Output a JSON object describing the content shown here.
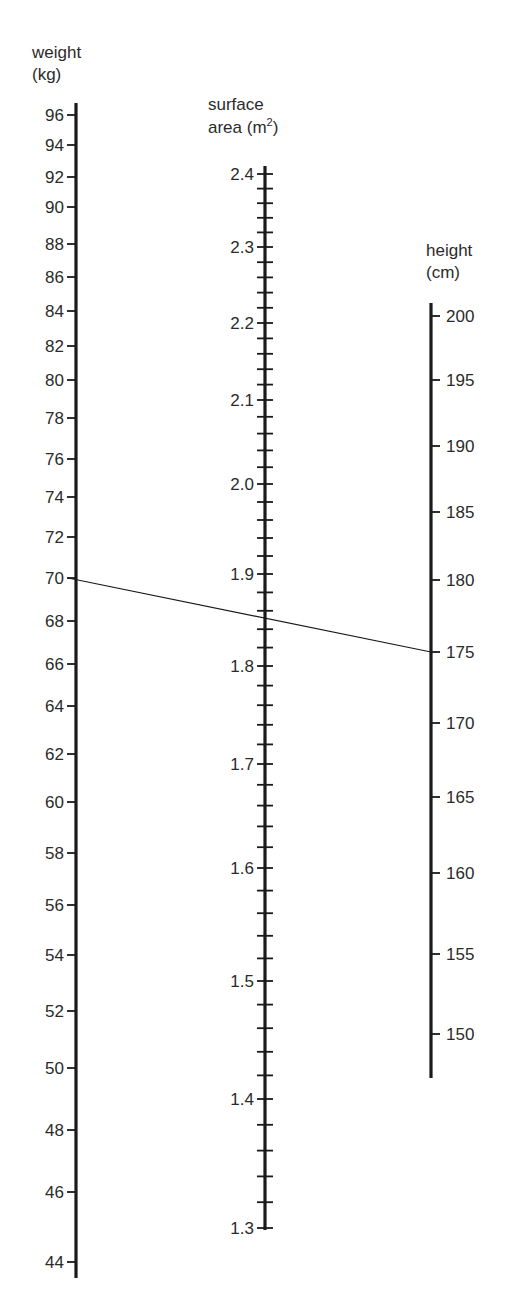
{
  "chart_data": {
    "type": "nomogram",
    "title": "",
    "axes": [
      {
        "id": "weight",
        "title_lines": [
          "weight",
          "(kg)"
        ],
        "unit": "kg",
        "range": [
          44,
          96
        ],
        "tick_side": "left",
        "ticks": [
          {
            "value": 96,
            "label": "96",
            "pos": 115
          },
          {
            "value": 94,
            "label": "94",
            "pos": 145
          },
          {
            "value": 92,
            "label": "92",
            "pos": 177
          },
          {
            "value": 90,
            "label": "90",
            "pos": 207
          },
          {
            "value": 88,
            "label": "88",
            "pos": 244
          },
          {
            "value": 86,
            "label": "86",
            "pos": 277
          },
          {
            "value": 84,
            "label": "84",
            "pos": 311
          },
          {
            "value": 82,
            "label": "82",
            "pos": 346
          },
          {
            "value": 80,
            "label": "80",
            "pos": 380
          },
          {
            "value": 78,
            "label": "78",
            "pos": 418
          },
          {
            "value": 76,
            "label": "76",
            "pos": 459
          },
          {
            "value": 74,
            "label": "74",
            "pos": 497
          },
          {
            "value": 72,
            "label": "72",
            "pos": 537
          },
          {
            "value": 70,
            "label": "70",
            "pos": 578
          },
          {
            "value": 68,
            "label": "68",
            "pos": 621
          },
          {
            "value": 66,
            "label": "66",
            "pos": 664
          },
          {
            "value": 64,
            "label": "64",
            "pos": 706
          },
          {
            "value": 62,
            "label": "62",
            "pos": 754
          },
          {
            "value": 60,
            "label": "60",
            "pos": 802
          },
          {
            "value": 58,
            "label": "58",
            "pos": 853
          },
          {
            "value": 56,
            "label": "56",
            "pos": 905
          },
          {
            "value": 54,
            "label": "54",
            "pos": 955
          },
          {
            "value": 52,
            "label": "52",
            "pos": 1011
          },
          {
            "value": 50,
            "label": "50",
            "pos": 1068
          },
          {
            "value": 48,
            "label": "48",
            "pos": 1130
          },
          {
            "value": 46,
            "label": "46",
            "pos": 1192
          },
          {
            "value": 44,
            "label": "44",
            "pos": 1262
          }
        ]
      },
      {
        "id": "surface_area",
        "title_lines": [
          "surface",
          "area (m",
          "2",
          ")"
        ],
        "unit": "m²",
        "range": [
          1.3,
          2.4
        ],
        "minor_step": 0.02,
        "tick_side": "both",
        "ticks": [
          {
            "value": 2.4,
            "label": "2.4",
            "pos": 174
          },
          {
            "value": 2.3,
            "label": "2.3",
            "pos": 247
          },
          {
            "value": 2.2,
            "label": "2.2",
            "pos": 323
          },
          {
            "value": 2.1,
            "label": "2.1",
            "pos": 400
          },
          {
            "value": 2.0,
            "label": "2.0",
            "pos": 484
          },
          {
            "value": 1.9,
            "label": "1.9",
            "pos": 574
          },
          {
            "value": 1.8,
            "label": "1.8",
            "pos": 666
          },
          {
            "value": 1.7,
            "label": "1.7",
            "pos": 764
          },
          {
            "value": 1.6,
            "label": "1.6",
            "pos": 868
          },
          {
            "value": 1.5,
            "label": "1.5",
            "pos": 981
          },
          {
            "value": 1.4,
            "label": "1.4",
            "pos": 1099
          },
          {
            "value": 1.3,
            "label": "1.3",
            "pos": 1228
          }
        ]
      },
      {
        "id": "height",
        "title_lines": [
          "height",
          "(cm)"
        ],
        "unit": "cm",
        "range": [
          147,
          201
        ],
        "tick_side": "right",
        "ticks": [
          {
            "value": 200,
            "label": "200",
            "pos": 316
          },
          {
            "value": 195,
            "label": "195",
            "pos": 380
          },
          {
            "value": 190,
            "label": "190",
            "pos": 446
          },
          {
            "value": 185,
            "label": "185",
            "pos": 512
          },
          {
            "value": 180,
            "label": "180",
            "pos": 580
          },
          {
            "value": 175,
            "label": "175",
            "pos": 652
          },
          {
            "value": 170,
            "label": "170",
            "pos": 723
          },
          {
            "value": 165,
            "label": "165",
            "pos": 797
          },
          {
            "value": 160,
            "label": "160",
            "pos": 873
          },
          {
            "value": 155,
            "label": "155",
            "pos": 954
          },
          {
            "value": 150,
            "label": "150",
            "pos": 1034
          }
        ]
      }
    ],
    "example_reading": {
      "weight_kg": 70,
      "height_cm": 175,
      "surface_area_m2": 1.85
    },
    "grid": false,
    "legend": "none"
  }
}
